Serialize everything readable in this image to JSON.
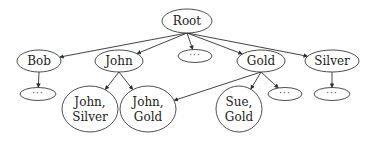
{
  "diagram": {
    "type": "tree",
    "nodes": [
      {
        "id": "root",
        "lines": [
          "Root"
        ]
      },
      {
        "id": "bob",
        "lines": [
          "Bob"
        ]
      },
      {
        "id": "john",
        "lines": [
          "John"
        ]
      },
      {
        "id": "mid_more",
        "lines": [
          "···"
        ],
        "ellipsis": true
      },
      {
        "id": "gold",
        "lines": [
          "Gold"
        ]
      },
      {
        "id": "silver",
        "lines": [
          "Silver"
        ]
      },
      {
        "id": "bob_more",
        "lines": [
          "···"
        ],
        "ellipsis": true
      },
      {
        "id": "john_silver",
        "lines": [
          "John,",
          "Silver"
        ]
      },
      {
        "id": "john_gold",
        "lines": [
          "John,",
          "Gold"
        ]
      },
      {
        "id": "sue_gold",
        "lines": [
          "Sue,",
          "Gold"
        ]
      },
      {
        "id": "gold_more",
        "lines": [
          "···"
        ],
        "ellipsis": true
      },
      {
        "id": "silver_more",
        "lines": [
          "···"
        ],
        "ellipsis": true
      }
    ],
    "edges": [
      {
        "from": "root",
        "to": "bob"
      },
      {
        "from": "root",
        "to": "john"
      },
      {
        "from": "root",
        "to": "mid_more"
      },
      {
        "from": "root",
        "to": "gold"
      },
      {
        "from": "root",
        "to": "silver"
      },
      {
        "from": "bob",
        "to": "bob_more"
      },
      {
        "from": "john",
        "to": "john_silver"
      },
      {
        "from": "john",
        "to": "john_gold"
      },
      {
        "from": "gold",
        "to": "john_gold"
      },
      {
        "from": "gold",
        "to": "sue_gold"
      },
      {
        "from": "gold",
        "to": "gold_more"
      },
      {
        "from": "silver",
        "to": "silver_more"
      }
    ]
  }
}
